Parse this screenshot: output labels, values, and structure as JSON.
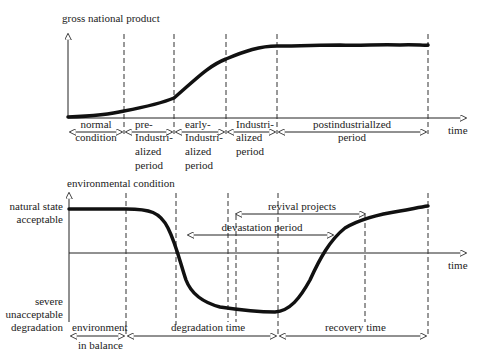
{
  "top_chart": {
    "y_axis_label": "gross national product",
    "x_axis_label": "time",
    "periods": [
      {
        "lines": [
          "normal",
          "condition"
        ]
      },
      {
        "lines": [
          "pre-",
          "Industri-",
          "alized",
          "period"
        ]
      },
      {
        "lines": [
          "early-",
          "Industri-",
          "alized",
          "period"
        ]
      },
      {
        "lines": [
          "Industri-",
          "alized",
          "period"
        ]
      },
      {
        "lines": [
          "postindustriallzed",
          "period"
        ]
      }
    ]
  },
  "bottom_chart": {
    "y_axis_label": "environmental condition",
    "x_axis_label": "time",
    "y_top_label": [
      "natural state",
      "acceptable"
    ],
    "y_bottom_label": [
      "severe",
      "unacceptable",
      "degradation"
    ],
    "spans": {
      "revival": "revival projects",
      "devastation": "devastation period"
    },
    "bottom_periods": {
      "balance": [
        "environment",
        "in balance"
      ],
      "degradation": "degradation time",
      "recovery": "recovery time"
    }
  },
  "colors": {
    "ink": "#222222",
    "curve": "#111111"
  }
}
